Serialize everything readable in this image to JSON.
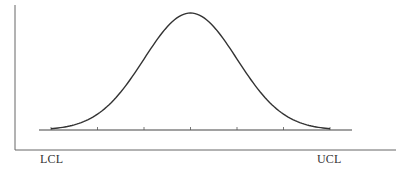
{
  "chart_data": {
    "type": "line",
    "title": "",
    "subtitle": "",
    "xlabel": "",
    "ylabel": "",
    "x_tick_count": 7,
    "x_tick_labels": [
      "LCL",
      "",
      "",
      "",
      "",
      "",
      "UCL"
    ],
    "annotations": [
      {
        "text": "LCL",
        "position": "left, below axis"
      },
      {
        "text": "UCL",
        "position": "right, below axis"
      }
    ],
    "series": [
      {
        "name": "distribution",
        "x": [
          -3,
          -2.5,
          -2,
          -1.5,
          -1,
          -0.5,
          0,
          0.5,
          1,
          1.5,
          2,
          2.5,
          3
        ],
        "values": [
          0.011,
          0.044,
          0.135,
          0.325,
          0.607,
          0.882,
          1.0,
          0.882,
          0.607,
          0.325,
          0.135,
          0.044,
          0.011
        ]
      }
    ],
    "xlim": [
      -3,
      3
    ],
    "ylim": [
      0,
      1
    ],
    "grid": false,
    "legend": "none"
  },
  "labels": {
    "lcl": "LCL",
    "ucl": "UCL"
  },
  "colors": {
    "line": "#333333",
    "axis": "#555555",
    "background": "#ffffff"
  }
}
